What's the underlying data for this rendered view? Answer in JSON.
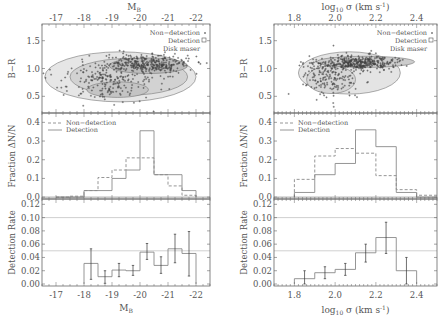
{
  "chart_data": [
    {
      "id": "left",
      "type": "composite",
      "top_axis_label": "M_B",
      "top_axis_ticks": [
        "-17",
        "-18",
        "-19",
        "-20",
        "-21",
        "-22"
      ],
      "bottom_axis_label": "M_B",
      "bottom_axis_ticks": [
        "-17",
        "-18",
        "-19",
        "-20",
        "-21",
        "-22"
      ],
      "xlim": [
        -16.5,
        -22.5
      ],
      "panels": [
        {
          "type": "scatter",
          "ylabel": "B-R",
          "ylim": [
            0.2,
            1.8
          ],
          "yticks": [
            "0.5",
            "1.0",
            "1.5"
          ],
          "legend": [
            "Non-detection",
            "Detection",
            "Disk maser"
          ],
          "legend_markers": [
            "+",
            "□",
            ""
          ],
          "contours": true,
          "description": "Dense cloud of non-detections with density contours; red sequence near B-R≈1.1 at bright end, blue cloud near 0.5–0.7 at faint end"
        },
        {
          "type": "step",
          "ylabel": "Fraction ΔN/N",
          "ylim": [
            -0.01,
            0.45
          ],
          "yticks": [
            "0.0",
            "0.1",
            "0.2",
            "0.3",
            "0.4"
          ],
          "bin_edges": [
            -17.0,
            -17.5,
            -18.0,
            -18.5,
            -19.0,
            -19.5,
            -20.0,
            -20.5,
            -21.0,
            -21.5,
            -22.0
          ],
          "series": [
            {
              "name": "Non-detection",
              "style": "dashed",
              "values": [
                0.0,
                0.005,
                0.035,
                0.105,
                0.145,
                0.21,
                0.21,
                0.12,
                0.06,
                0.01
              ]
            },
            {
              "name": "Detection",
              "style": "solid",
              "values": [
                0.0,
                0.0,
                0.035,
                0.035,
                0.1,
                0.145,
                0.355,
                0.12,
                0.12,
                0.035
              ]
            }
          ]
        },
        {
          "type": "step_errorbar",
          "ylabel": "Detection Rate",
          "ylim": [
            -0.003,
            0.128
          ],
          "yticks": [
            "0.00",
            "0.02",
            "0.04",
            "0.06",
            "0.08",
            "0.10",
            "0.12"
          ],
          "hlines": [
            0.05,
            0.1
          ],
          "bin_edges": [
            -18.0,
            -18.5,
            -19.0,
            -19.5,
            -20.0,
            -20.5,
            -21.0,
            -21.5,
            -22.0
          ],
          "values": [
            0.031,
            0.011,
            0.021,
            0.02,
            0.048,
            0.028,
            0.053,
            0.046
          ],
          "err_low": [
            0.007,
            0.001,
            0.011,
            0.013,
            0.037,
            0.016,
            0.032,
            0.012
          ],
          "err_high": [
            0.053,
            0.02,
            0.031,
            0.028,
            0.061,
            0.041,
            0.075,
            0.079
          ]
        }
      ]
    },
    {
      "id": "right",
      "type": "composite",
      "top_axis_label": "log10 σ (km s^-1)",
      "top_axis_ticks": [
        "1.8",
        "2.0",
        "2.2",
        "2.4"
      ],
      "bottom_axis_label": "log10 σ (km s^-1)",
      "bottom_axis_ticks": [
        "1.8",
        "2.0",
        "2.2",
        "2.4"
      ],
      "xlim": [
        1.7,
        2.5
      ],
      "panels": [
        {
          "type": "scatter",
          "ylabel": "B-R",
          "ylim": [
            0.2,
            1.8
          ],
          "yticks": [
            "0.5",
            "1.0",
            "1.5"
          ],
          "legend": [
            "Non-detection",
            "Detection",
            "Disk maser"
          ],
          "legend_markers": [
            "+",
            "□",
            ""
          ],
          "contours": true,
          "description": "Non-detections concentrated from σ≈1.85–2.4 with tight red sequence near B-R≈1.15 at high σ"
        },
        {
          "type": "step",
          "ylabel": "Fraction ΔN/N",
          "ylim": [
            -0.01,
            0.45
          ],
          "yticks": [
            "0.0",
            "0.1",
            "0.2",
            "0.3",
            "0.4"
          ],
          "bin_edges": [
            1.8,
            1.9,
            2.0,
            2.1,
            2.2,
            2.3,
            2.4,
            2.5
          ],
          "series": [
            {
              "name": "Non-detection",
              "style": "dashed",
              "values": [
                0.095,
                0.22,
                0.26,
                0.235,
                0.115,
                0.04,
                0.01
              ]
            },
            {
              "name": "Detection",
              "style": "solid",
              "values": [
                0.025,
                0.12,
                0.18,
                0.36,
                0.27,
                0.025,
                0.0
              ]
            }
          ]
        },
        {
          "type": "step_errorbar",
          "ylabel": "Detection Rate",
          "ylim": [
            -0.003,
            0.128
          ],
          "yticks": [
            "0.00",
            "0.02",
            "0.04",
            "0.06",
            "0.08",
            "0.10",
            "0.12"
          ],
          "hlines": [
            0.05,
            0.1
          ],
          "bin_edges": [
            1.8,
            1.9,
            2.0,
            2.1,
            2.2,
            2.3,
            2.4
          ],
          "values": [
            0.008,
            0.017,
            0.022,
            0.047,
            0.07,
            0.02
          ],
          "err_low": [
            0.0,
            0.008,
            0.013,
            0.033,
            0.046,
            0.0
          ],
          "err_high": [
            0.02,
            0.026,
            0.031,
            0.06,
            0.093,
            0.04
          ]
        }
      ]
    }
  ],
  "labels": {
    "left_top_axis": "M",
    "left_top_axis_sub": "B",
    "left_bottom_axis": "M",
    "left_bottom_axis_sub": "B",
    "right_axis_pre": "log",
    "right_axis_sub": "10",
    "right_axis_post": " σ (km s",
    "right_axis_sup": "-1",
    "right_axis_close": ")",
    "ylabel_color": "B−R",
    "ylabel_fraction": "Fraction  ΔN/N",
    "ylabel_rate": "Detection  Rate",
    "legend_nondet": "Non−detection",
    "legend_det": "Detection",
    "legend_maser": "Disk maser",
    "hist_legend_nondet": "Non−detection",
    "hist_legend_det": "Detection"
  }
}
